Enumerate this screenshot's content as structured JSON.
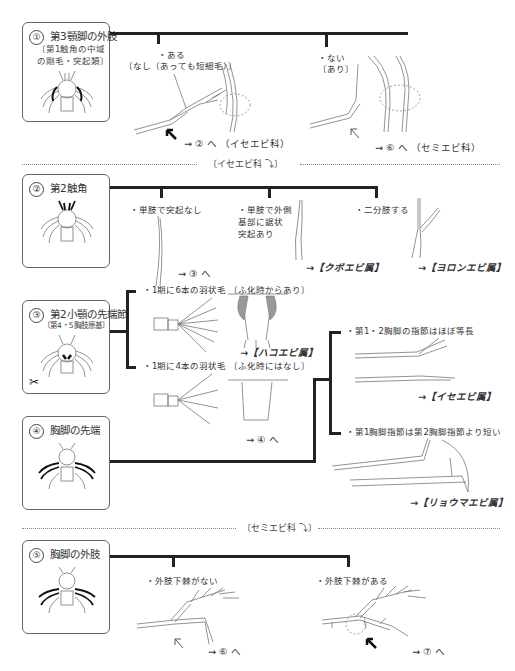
{
  "sections": {
    "s1": {
      "number": "①",
      "title": "第3顎脚の外肢",
      "subtitle_lines": [
        "〔第1触角の中域",
        "の剛毛・突起類〕"
      ],
      "options": [
        {
          "label": "・ある",
          "sub": "〔なし（あっても短細毛）〕",
          "result": "→ ② へ （イセエビ科）"
        },
        {
          "label": "・ない",
          "sub": "〔あり〕",
          "result": "→ ⑥ へ （セミエビ科）"
        }
      ]
    },
    "s2": {
      "number": "②",
      "title": "第2触角",
      "options": [
        {
          "label": "・単肢で突起なし",
          "result": "→ ③ へ"
        },
        {
          "label_lines": [
            "・単肢で外側",
            "基部に鋸状",
            "突起あり"
          ],
          "result": "→【クボエビ属】"
        },
        {
          "label": "・二分肢する",
          "result": "→【ヨロンエビ属】"
        }
      ]
    },
    "s3": {
      "number": "③",
      "title": "第2小顎の先端節",
      "subtitle": "〔第4・5胸肢原基〕",
      "options": [
        {
          "label": "・1期に6本の羽状毛 〔ふ化時からあり〕",
          "result": "→【ハコエビ属】"
        },
        {
          "label": "・1期に4本の羽状毛 〔ふ化時にはなし〕",
          "result": "→ ④ へ"
        }
      ]
    },
    "s4": {
      "number": "④",
      "title": "胸脚の先端",
      "options": [
        {
          "label": "・第1・2胸脚の指節はほぼ等長",
          "result": "→【イセエビ属】"
        },
        {
          "label": "・第1胸脚指節は第2胸脚指節より短い",
          "result": "→【リョウマエビ属】"
        }
      ]
    },
    "s5": {
      "number": "⑤",
      "title": "胸脚の外肢",
      "options": [
        {
          "label": "・外肢下棘がない",
          "result": "→ ⑥ へ"
        },
        {
          "label": "・外肢下棘がある",
          "result": "→ ⑦ へ"
        }
      ]
    }
  },
  "dividers": {
    "ise": "〔イセエビ科 ⤵〕",
    "semi": "〔セミエビ科 ⤵〕"
  },
  "icons": {
    "scissors": "✂",
    "arrow_solid": "solid-arrow",
    "arrow_hollow": "hollow-arrow"
  },
  "colors": {
    "line": "#222222",
    "box_border": "#666666",
    "highlight_gray": "#999999",
    "dashed_circle": "#888888"
  }
}
